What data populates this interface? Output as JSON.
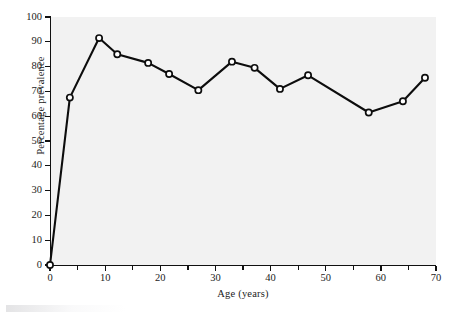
{
  "chart_data": {
    "type": "line",
    "title": "",
    "xlabel": "Age (years)",
    "ylabel": "Percentage prevalence",
    "xlim": [
      0,
      70
    ],
    "ylim": [
      0,
      100
    ],
    "xticks": [
      0,
      10,
      20,
      30,
      40,
      50,
      60,
      70
    ],
    "xticks_minor": [
      5,
      15,
      25,
      35,
      45,
      55,
      65
    ],
    "yticks": [
      0,
      10,
      20,
      30,
      40,
      50,
      60,
      70,
      80,
      90,
      100
    ],
    "xtick_labels": [
      "0",
      "10",
      "20",
      "30",
      "40",
      "50",
      "60",
      "70"
    ],
    "ytick_labels": [
      "0",
      "10",
      "20",
      "30",
      "40",
      "50",
      "60",
      "70",
      "80",
      "90",
      "100"
    ],
    "grid": false,
    "legend": null,
    "marker": "open-circle",
    "series": [
      {
        "name": "Percentage prevalence by age",
        "x": [
          0,
          3.6,
          8.9,
          12.2,
          17.8,
          21.6,
          26.9,
          33,
          37.1,
          41.7,
          46.8,
          57.8,
          64,
          68
        ],
        "y": [
          0,
          67.5,
          91.5,
          85,
          81.5,
          77,
          70.5,
          82,
          79.5,
          71,
          76.5,
          61.5,
          66,
          75.5
        ]
      }
    ],
    "colors": {
      "line": "#0d0d0d",
      "marker_face": "#ffffff",
      "marker_edge": "#0d0d0d",
      "plot_background": "#f2f2f2",
      "axis": "#111111",
      "text": "#1c1c1c"
    }
  }
}
